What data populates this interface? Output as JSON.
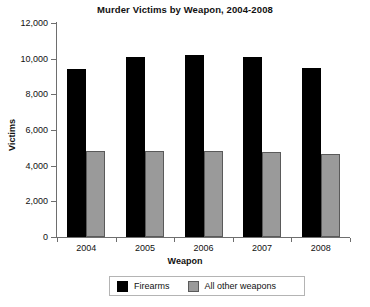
{
  "chart_data": {
    "type": "bar",
    "title": "Murder Victims by Weapon, 2004-2008",
    "xlabel": "Weapon",
    "ylabel": "Victims",
    "categories": [
      "2004",
      "2005",
      "2006",
      "2007",
      "2008"
    ],
    "series": [
      {
        "name": "Firearms",
        "color": "#000000",
        "values": [
          9400,
          10100,
          10200,
          10100,
          9500
        ]
      },
      {
        "name": "All other weapons",
        "color": "#9a9a9a",
        "values": [
          4800,
          4800,
          4800,
          4750,
          4650
        ]
      }
    ],
    "ylim": [
      0,
      12000
    ],
    "ytick_step": 2000,
    "ytick_labels": [
      "0",
      "2,000",
      "4,000",
      "6,000",
      "8,000",
      "10,000",
      "12,000"
    ],
    "ytick_values": [
      0,
      2000,
      4000,
      6000,
      8000,
      10000,
      12000
    ],
    "grid": false,
    "legend_position": "bottom",
    "legend_entries": [
      "Firearms",
      "All other weapons"
    ]
  }
}
